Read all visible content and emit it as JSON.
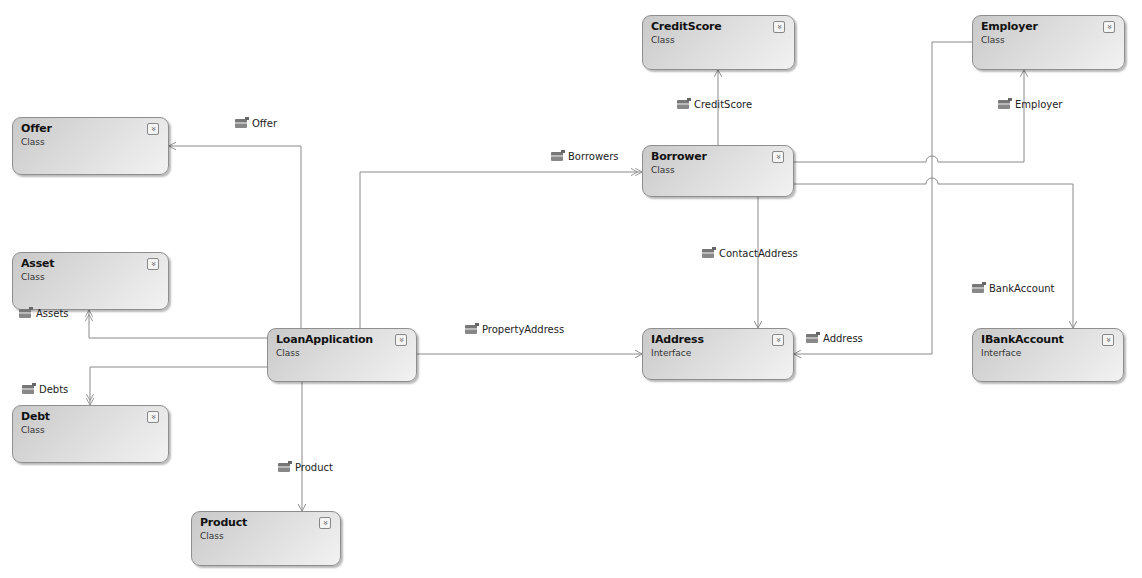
{
  "diagram": {
    "type": "class-diagram",
    "shapes": [
      {
        "id": "offer",
        "name": "Offer",
        "kind": "Class",
        "x": 12,
        "y": 117,
        "w": 157,
        "h": 58
      },
      {
        "id": "asset",
        "name": "Asset",
        "kind": "Class",
        "x": 12,
        "y": 252,
        "w": 157,
        "h": 58
      },
      {
        "id": "debt",
        "name": "Debt",
        "kind": "Class",
        "x": 12,
        "y": 405,
        "w": 157,
        "h": 58
      },
      {
        "id": "loanapplication",
        "name": "LoanApplication",
        "kind": "Class",
        "x": 267,
        "y": 328,
        "w": 150,
        "h": 54
      },
      {
        "id": "product",
        "name": "Product",
        "kind": "Class",
        "x": 191,
        "y": 511,
        "w": 150,
        "h": 55
      },
      {
        "id": "creditscore",
        "name": "CreditScore",
        "kind": "Class",
        "x": 642,
        "y": 15,
        "w": 153,
        "h": 55
      },
      {
        "id": "borrower",
        "name": "Borrower",
        "kind": "Class",
        "x": 642,
        "y": 145,
        "w": 152,
        "h": 52
      },
      {
        "id": "employer",
        "name": "Employer",
        "kind": "Class",
        "x": 972,
        "y": 15,
        "w": 153,
        "h": 55
      },
      {
        "id": "iaddress",
        "name": "IAddress",
        "kind": "Interface",
        "x": 642,
        "y": 328,
        "w": 152,
        "h": 52
      },
      {
        "id": "ibankaccount",
        "name": "IBankAccount",
        "kind": "Interface",
        "x": 972,
        "y": 328,
        "w": 152,
        "h": 54
      }
    ],
    "associations": [
      {
        "id": "offer",
        "label": "Offer",
        "from": "LoanApplication",
        "to": "Offer",
        "label_x": 235,
        "label_y": 118
      },
      {
        "id": "assets",
        "label": "Assets",
        "from": "LoanApplication",
        "to": "Asset",
        "label_x": 19,
        "label_y": 308
      },
      {
        "id": "debts",
        "label": "Debts",
        "from": "LoanApplication",
        "to": "Debt",
        "label_x": 22,
        "label_y": 384
      },
      {
        "id": "product",
        "label": "Product",
        "from": "LoanApplication",
        "to": "Product",
        "label_x": 278,
        "label_y": 462
      },
      {
        "id": "borrowers",
        "label": "Borrowers",
        "from": "LoanApplication",
        "to": "Borrower",
        "label_x": 551,
        "label_y": 151
      },
      {
        "id": "propertyaddress",
        "label": "PropertyAddress",
        "from": "LoanApplication",
        "to": "IAddress",
        "label_x": 465,
        "label_y": 324
      },
      {
        "id": "creditscore",
        "label": "CreditScore",
        "from": "Borrower",
        "to": "CreditScore",
        "label_x": 677,
        "label_y": 99
      },
      {
        "id": "employer",
        "label": "Employer",
        "from": "Borrower",
        "to": "Employer",
        "label_x": 998,
        "label_y": 99
      },
      {
        "id": "contactaddress",
        "label": "ContactAddress",
        "from": "Borrower",
        "to": "IAddress",
        "label_x": 702,
        "label_y": 248
      },
      {
        "id": "address",
        "label": "Address",
        "from": "Employer",
        "to": "IAddress",
        "label_x": 806,
        "label_y": 333
      },
      {
        "id": "bankaccount",
        "label": "BankAccount",
        "from": "Borrower",
        "to": "IBankAccount",
        "label_x": 972,
        "label_y": 283
      }
    ],
    "toggle_glyph": "»",
    "colors": {
      "line": "#8a8a8a",
      "shape_border": "#8e8e8e",
      "text": "#111111"
    }
  }
}
